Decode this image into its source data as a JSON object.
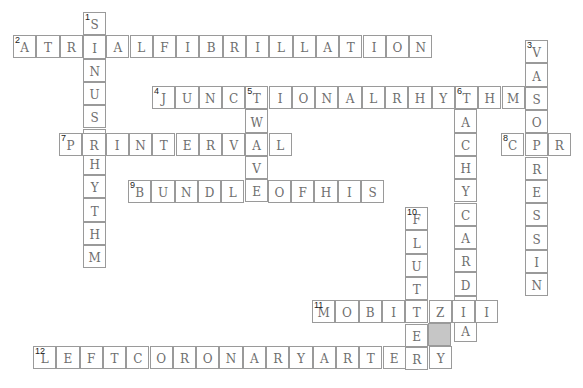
{
  "puzzle": {
    "cell_size": 23.3,
    "colors": {
      "grid_line": "#9a9a9a",
      "letter": "#6e6e6e",
      "number": "#222222",
      "shaded_cell": "#c6c6c6",
      "background": "#ffffff"
    },
    "words": [
      {
        "number": "1",
        "direction": "down",
        "answer": "SINUSRHYTHM",
        "x": 83,
        "y": 12
      },
      {
        "number": "2",
        "direction": "across",
        "answer": "ATRIALFIBRILLATION",
        "x": 13,
        "y": 35
      },
      {
        "number": "3",
        "direction": "down",
        "answer": "VASOPRESSIN",
        "x": 525,
        "y": 40
      },
      {
        "number": "4",
        "direction": "across",
        "answer": "JUNCTIONALRHYTHMS",
        "x": 152,
        "y": 86
      },
      {
        "number": "5",
        "direction": "down",
        "answer": "TWAVE",
        "x": 245,
        "y": 86
      },
      {
        "number": "6",
        "direction": "down",
        "answer": "TACHYCARDIA",
        "x": 454,
        "y": 86
      },
      {
        "number": "7",
        "direction": "across",
        "answer": "PRINTERVAL",
        "x": 59,
        "y": 133
      },
      {
        "number": "8",
        "direction": "across",
        "answer": "CPR",
        "x": 501,
        "y": 133
      },
      {
        "number": "9",
        "direction": "across",
        "answer": "BUNDLEOFHIS",
        "x": 128,
        "y": 180
      },
      {
        "number": "10",
        "direction": "down",
        "answer": "FLUTTER",
        "x": 405,
        "y": 207
      },
      {
        "number": "11",
        "direction": "across",
        "answer": "MOBITZII",
        "x": 312,
        "y": 300
      },
      {
        "number": "12",
        "direction": "across",
        "answer": "LEFTCORONARYARTERY",
        "x": 33,
        "y": 346
      }
    ],
    "shaded_cells": [
      {
        "x": 428,
        "y": 323,
        "w": 23.3,
        "h": 23.3
      }
    ]
  }
}
